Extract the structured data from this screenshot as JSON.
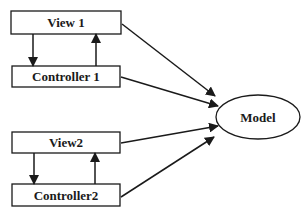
{
  "diagram": {
    "title": "",
    "colors": {
      "stroke": "#1a1a1a",
      "fill": "#ffffff",
      "background": "#ffffff"
    },
    "nodes": [
      {
        "id": "view1",
        "label": "View 1",
        "shape": "rect"
      },
      {
        "id": "controller1",
        "label": "Controller 1",
        "shape": "rect"
      },
      {
        "id": "view2",
        "label": "View2",
        "shape": "rect"
      },
      {
        "id": "controller2",
        "label": "Controller2",
        "shape": "rect"
      },
      {
        "id": "model",
        "label": "Model",
        "shape": "ellipse"
      }
    ],
    "edges": [
      {
        "from": "view1",
        "to": "controller1"
      },
      {
        "from": "controller1",
        "to": "view1"
      },
      {
        "from": "view2",
        "to": "controller2"
      },
      {
        "from": "controller2",
        "to": "view2"
      },
      {
        "from": "view1",
        "to": "model"
      },
      {
        "from": "controller1",
        "to": "model"
      },
      {
        "from": "view2",
        "to": "model"
      },
      {
        "from": "controller2",
        "to": "model"
      }
    ]
  }
}
